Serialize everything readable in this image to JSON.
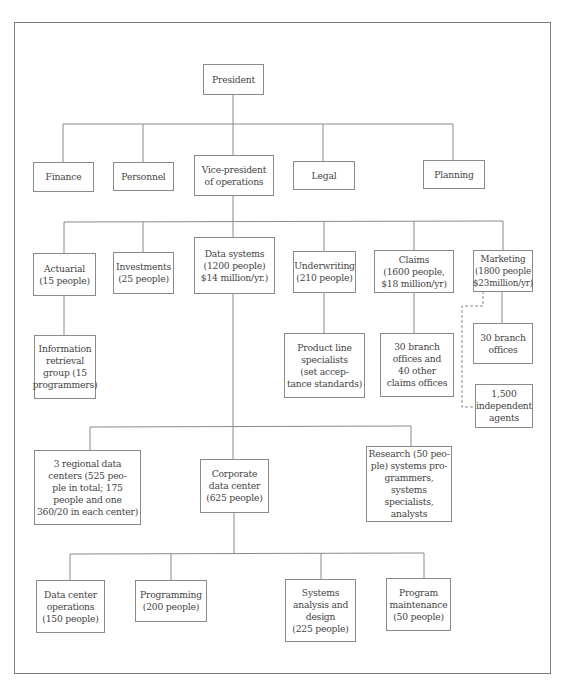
{
  "chart": {
    "type": "org-chart",
    "nodes": {
      "president": {
        "label": "President"
      },
      "finance": {
        "label": "Finance"
      },
      "personnel": {
        "label": "Personnel"
      },
      "vp_operations": {
        "label": "Vice-president\nof operations"
      },
      "legal": {
        "label": "Legal"
      },
      "planning": {
        "label": "Planning"
      },
      "actuarial": {
        "label": "Actuarial\n(15 people)"
      },
      "investments": {
        "label": "Investments\n(25 people)"
      },
      "data_systems": {
        "label": "Data systems\n(1200 people)\n$14 million/yr.)"
      },
      "underwriting": {
        "label": "Underwriting\n(210 people)"
      },
      "claims": {
        "label": "Claims\n(1600 people,\n$18 million/yr)"
      },
      "marketing": {
        "label": "Marketing\n(1800 people\n$23million/yr)"
      },
      "info_retrieval": {
        "label": "Information\nretrieval\ngroup (15\nprogrammers)"
      },
      "product_line": {
        "label": "Product line\nspecialists\n(set accep-\ntance standards)"
      },
      "claims_offices": {
        "label": "30 branch\noffices and\n40 other\nclaims offices"
      },
      "marketing_branches": {
        "label": "30 branch\noffices"
      },
      "independent_agents": {
        "label": "1,500\nindependent\nagents"
      },
      "regional_centers": {
        "label": "3 regional data\ncenters (525 peo-\nple in total; 175\npeople and one\n360/20 in each center)"
      },
      "corporate_center": {
        "label": "Corporate\ndata center\n(625 people)"
      },
      "research": {
        "label": "Research (50 peo-\nple) systems pro-\ngrammers, systems\nspecialists,\nanalysts"
      },
      "dc_operations": {
        "label": "Data center\noperations\n(150 people)"
      },
      "programming": {
        "label": "Programming\n(200 people)"
      },
      "systems_analysis": {
        "label": "Systems\nanalysis and\ndesign\n(225 people)"
      },
      "program_maintenance": {
        "label": "Program\nmaintenance\n(50 people)"
      }
    },
    "edges": [
      [
        "president",
        "finance"
      ],
      [
        "president",
        "personnel"
      ],
      [
        "president",
        "vp_operations"
      ],
      [
        "president",
        "legal"
      ],
      [
        "president",
        "planning"
      ],
      [
        "vp_operations",
        "actuarial"
      ],
      [
        "vp_operations",
        "investments"
      ],
      [
        "vp_operations",
        "data_systems"
      ],
      [
        "vp_operations",
        "underwriting"
      ],
      [
        "vp_operations",
        "claims"
      ],
      [
        "vp_operations",
        "marketing"
      ],
      [
        "actuarial",
        "info_retrieval"
      ],
      [
        "underwriting",
        "product_line"
      ],
      [
        "claims",
        "claims_offices"
      ],
      [
        "marketing",
        "marketing_branches"
      ],
      [
        "data_systems",
        "regional_centers"
      ],
      [
        "data_systems",
        "corporate_center"
      ],
      [
        "data_systems",
        "research"
      ],
      [
        "corporate_center",
        "dc_operations"
      ],
      [
        "corporate_center",
        "programming"
      ],
      [
        "corporate_center",
        "systems_analysis"
      ],
      [
        "corporate_center",
        "program_maintenance"
      ]
    ],
    "dashed_edges": [
      [
        "marketing",
        "independent_agents"
      ]
    ],
    "colors": {
      "line": "#8a8a8a",
      "frame": "#7a7a7a",
      "text": "#444444",
      "background": "#ffffff"
    }
  }
}
